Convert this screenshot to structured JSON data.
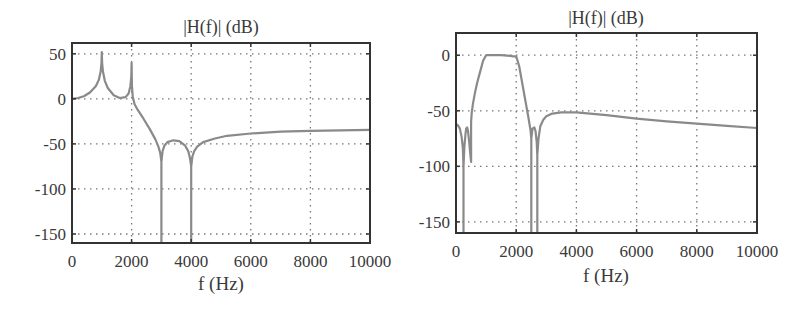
{
  "chart_data": [
    {
      "type": "line",
      "title": "|H(f)| (dB)",
      "xlabel": "f (Hz)",
      "ylabel": "",
      "xlim": [
        0,
        10000
      ],
      "ylim": [
        -160,
        62
      ],
      "xticks": [
        0,
        2000,
        4000,
        6000,
        8000,
        10000
      ],
      "xtick_labels": [
        "0",
        "2000",
        "4000",
        "6000",
        "8000",
        "10000"
      ],
      "yticks": [
        50,
        0,
        -50,
        -100,
        -150
      ],
      "ytick_labels": [
        "50",
        "0",
        "-50",
        "-100",
        "-150"
      ],
      "grid": true,
      "frame": {
        "left": 72,
        "top": 43,
        "right": 370,
        "bottom": 243
      },
      "series": [
        {
          "name": "|H(f)|",
          "color": "#8a8a8a",
          "x": [
            0,
            200,
            400,
            600,
            800,
            900,
            960,
            990,
            1000,
            1010,
            1040,
            1100,
            1200,
            1400,
            1600,
            1800,
            1900,
            1960,
            1990,
            2000,
            2010,
            2040,
            2100,
            2200,
            2400,
            2600,
            2800,
            2900,
            2960,
            3000,
            3000,
            3000,
            3040,
            3100,
            3200,
            3400,
            3600,
            3800,
            3900,
            3960,
            4000,
            4000,
            4000,
            4040,
            4100,
            4200,
            4400,
            4800,
            5200,
            6000,
            7000,
            8000,
            9000,
            10000
          ],
          "y": [
            0,
            1,
            3,
            7,
            14,
            21,
            30,
            40,
            52,
            40,
            30,
            20,
            12,
            4,
            1,
            2,
            6,
            14,
            25,
            40,
            15,
            2,
            -6,
            -12,
            -22,
            -33,
            -45,
            -53,
            -60,
            -70,
            -160,
            -70,
            -58,
            -52,
            -48,
            -46,
            -47,
            -52,
            -58,
            -66,
            -75,
            -160,
            -75,
            -64,
            -58,
            -53,
            -48,
            -44,
            -41,
            -38.5,
            -36.5,
            -35.5,
            -35,
            -34.5
          ]
        }
      ]
    },
    {
      "type": "line",
      "title": "|H(f)| (dB)",
      "xlabel": "f (Hz)",
      "ylabel": "",
      "xlim": [
        0,
        10000
      ],
      "ylim": [
        -160,
        20
      ],
      "xticks": [
        0,
        2000,
        4000,
        6000,
        8000,
        10000
      ],
      "xtick_labels": [
        "0",
        "2000",
        "4000",
        "6000",
        "8000",
        "10000"
      ],
      "yticks": [
        0,
        -50,
        -100,
        -150
      ],
      "ytick_labels": [
        "0",
        "-50",
        "-100",
        "-150"
      ],
      "grid": true,
      "frame": {
        "left": 456,
        "top": 33,
        "right": 757,
        "bottom": 233
      },
      "series": [
        {
          "name": "|H(f)|",
          "color": "#8a8a8a",
          "x": [
            0,
            60,
            130,
            190,
            230,
            250,
            250,
            250,
            280,
            320,
            340,
            370,
            400,
            440,
            480,
            500,
            500,
            520,
            560,
            620,
            700,
            800,
            900,
            1000,
            1200,
            1500,
            1800,
            1900,
            2000,
            2100,
            2200,
            2300,
            2400,
            2480,
            2500,
            2500,
            2500,
            2540,
            2600,
            2640,
            2680,
            2700,
            2700,
            2700,
            2740,
            2800,
            2900,
            3000,
            3200,
            3500,
            4000,
            5000,
            6000,
            7000,
            8000,
            9000,
            10000
          ],
          "y": [
            -62,
            -63,
            -66,
            -74,
            -84,
            -100,
            -160,
            -100,
            -82,
            -70,
            -66,
            -65,
            -68,
            -78,
            -90,
            -96,
            -60,
            -52,
            -44,
            -35,
            -25,
            -15,
            -5,
            0,
            0,
            0,
            -0.5,
            -1,
            -1,
            -10,
            -25,
            -40,
            -55,
            -68,
            -75,
            -160,
            -75,
            -66,
            -65,
            -68,
            -78,
            -90,
            -160,
            -90,
            -75,
            -64,
            -58,
            -55,
            -52.5,
            -51.5,
            -51.5,
            -54,
            -57,
            -59.5,
            -61.5,
            -63.5,
            -65.5
          ]
        }
      ]
    }
  ]
}
